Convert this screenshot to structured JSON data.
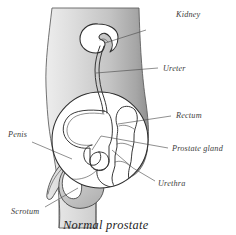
{
  "figure": {
    "title": "Normal prostate",
    "labels": [
      {
        "id": "kidney",
        "text": "Kidney",
        "x": 176,
        "y": 17,
        "leader": {
          "x1": 146,
          "y1": 30,
          "x2": 105,
          "y2": 43
        }
      },
      {
        "id": "ureter",
        "text": "Ureter",
        "x": 163,
        "y": 71,
        "leader": {
          "x1": 158,
          "y1": 68,
          "x2": 96,
          "y2": 73
        }
      },
      {
        "id": "rectum",
        "text": "Rectum",
        "x": 176,
        "y": 118,
        "leader": {
          "x1": 171,
          "y1": 116,
          "x2": 118,
          "y2": 124
        }
      },
      {
        "id": "prostate-gland",
        "text": "Prostate gland",
        "x": 172,
        "y": 151,
        "leader": {
          "x1": 168,
          "y1": 148,
          "x2": 101,
          "y2": 136
        }
      },
      {
        "id": "urethra",
        "text": "Urethra",
        "x": 158,
        "y": 186,
        "leader": {
          "x1": 155,
          "y1": 181,
          "x2": 133,
          "y2": 168
        }
      },
      {
        "id": "penis",
        "text": "Penis",
        "x": 8,
        "y": 137,
        "leader": {
          "x1": 32,
          "y1": 142,
          "x2": 72,
          "y2": 159
        }
      },
      {
        "id": "scrotum",
        "text": "Scrotum",
        "x": 11,
        "y": 214,
        "leader": {
          "x1": 45,
          "y1": 207,
          "x2": 78,
          "y2": 188
        }
      }
    ],
    "organs": [
      {
        "id": "kidney",
        "name": "kidney"
      },
      {
        "id": "ureter",
        "name": "ureter"
      },
      {
        "id": "bladder",
        "name": "bladder"
      },
      {
        "id": "rectum",
        "name": "rectum"
      },
      {
        "id": "prostate",
        "name": "prostate-gland"
      },
      {
        "id": "urethra",
        "name": "urethra"
      },
      {
        "id": "penis",
        "name": "penis"
      },
      {
        "id": "scrotum",
        "name": "scrotum"
      },
      {
        "id": "pelvis-circle",
        "name": "pelvic-cavity"
      }
    ],
    "colors": {
      "body_light": "#e3e3e3",
      "body_mid": "#c9c9c9",
      "body_dark": "#9c9c9c",
      "cavity": "#ffffff",
      "outline": "#2e2e2e",
      "label_text": "#3c3c3c",
      "caption_text": "#1f1f1f",
      "background": "#ffffff"
    }
  }
}
